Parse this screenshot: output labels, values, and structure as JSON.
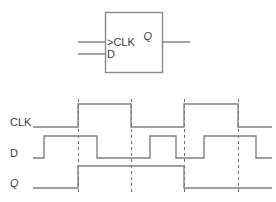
{
  "figure": {
    "colors": {
      "line": "#808080",
      "box": "#8a8a8a",
      "dash": "#6e6e6e",
      "text": "#3d3d3d",
      "background": "#ffffff"
    }
  },
  "symbol": {
    "box": {
      "x": 105,
      "y": 12,
      "width": 57,
      "height": 60
    },
    "clk_label": ">CLK",
    "d_label": "D",
    "q_label": "Q",
    "clk_pin_y": 42,
    "d_pin_y": 54,
    "q_pin_y": 42,
    "input_stub_x1": 78,
    "input_stub_x2": 105,
    "output_stub_x1": 162,
    "output_stub_x2": 190
  },
  "timing": {
    "labels": {
      "clk": "CLK",
      "d": "D",
      "q": "Q"
    },
    "label_x": 10,
    "axis": {
      "x_start": 33,
      "x_end": 272,
      "dashed_lines": [
        78,
        131,
        184,
        238
      ]
    },
    "rows": [
      {
        "name": "CLK",
        "label": "CLK",
        "label_y": 126,
        "low_y": 127,
        "high_y": 104,
        "edges": [
          78,
          131,
          184,
          238
        ],
        "start_level": 0,
        "points": "33,127 78,127 78,104 131,104 131,127 184,127 184,104 238,104 238,127 272,127"
      },
      {
        "name": "D",
        "label": "D",
        "label_y": 157,
        "low_y": 158,
        "high_y": 136,
        "edges": [
          44,
          97,
          150,
          176,
          204,
          256
        ],
        "start_level": 0,
        "points": "33,158 44,158 44,136 97,136 97,158 150,158 150,136 176,136 176,158 204,158 204,136 256,136 256,158 272,158"
      },
      {
        "name": "Q",
        "label": "Q",
        "label_y": 187,
        "low_y": 188,
        "high_y": 166,
        "edges": [
          78,
          184
        ],
        "start_level": 0,
        "points": "33,188 78,188 78,166 184,166 184,188 272,188"
      }
    ],
    "dash_segments": [
      {
        "x": 78,
        "y1": 99,
        "y2": 194
      },
      {
        "x": 131,
        "y1": 99,
        "y2": 194
      },
      {
        "x": 184,
        "y1": 99,
        "y2": 194
      },
      {
        "x": 238,
        "y1": 99,
        "y2": 194
      }
    ]
  }
}
